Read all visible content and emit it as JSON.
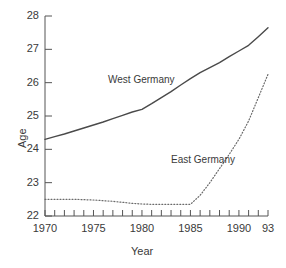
{
  "chart_data": {
    "type": "line",
    "title": "",
    "xlabel": "Year",
    "ylabel": "Age",
    "xlim": [
      1970,
      1993
    ],
    "ylim": [
      22,
      28
    ],
    "grid": false,
    "legend_position": "inline-annotation",
    "x_tick_labels": [
      "1970",
      "1975",
      "1980",
      "1985",
      "1990",
      "93"
    ],
    "x_tick_values": [
      1970,
      1975,
      1980,
      1985,
      1990,
      1993
    ],
    "x_minor_ticks": [
      1971,
      1972,
      1973,
      1974,
      1976,
      1977,
      1978,
      1979,
      1981,
      1982,
      1983,
      1984,
      1986,
      1987,
      1988,
      1989,
      1991,
      1992
    ],
    "y_tick_labels": [
      "22",
      "23",
      "24",
      "25",
      "26",
      "27",
      "28"
    ],
    "y_tick_values": [
      22,
      23,
      24,
      25,
      26,
      27,
      28
    ],
    "series": [
      {
        "name": "West Germany",
        "style": "solid",
        "color": "#4a4a4a",
        "x": [
          1970,
          1971,
          1972,
          1973,
          1974,
          1975,
          1976,
          1977,
          1978,
          1979,
          1980,
          1981,
          1982,
          1983,
          1984,
          1985,
          1986,
          1987,
          1988,
          1989,
          1990,
          1991,
          1992,
          1993
        ],
        "values": [
          24.3,
          24.38,
          24.46,
          24.55,
          24.64,
          24.73,
          24.82,
          24.92,
          25.02,
          25.12,
          25.2,
          25.37,
          25.55,
          25.73,
          25.93,
          26.12,
          26.3,
          26.45,
          26.6,
          26.78,
          26.95,
          27.12,
          27.38,
          27.65
        ]
      },
      {
        "name": "East Germany",
        "style": "dotted",
        "color": "#6a6a6a",
        "x": [
          1970,
          1971,
          1972,
          1973,
          1974,
          1975,
          1976,
          1977,
          1978,
          1979,
          1980,
          1981,
          1982,
          1983,
          1984,
          1985,
          1986,
          1987,
          1988,
          1989,
          1990,
          1991,
          1992,
          1993
        ],
        "values": [
          22.5,
          22.5,
          22.5,
          22.5,
          22.49,
          22.48,
          22.46,
          22.44,
          22.41,
          22.38,
          22.36,
          22.35,
          22.35,
          22.35,
          22.35,
          22.35,
          22.62,
          23.0,
          23.42,
          23.85,
          24.3,
          24.85,
          25.55,
          26.25
        ]
      }
    ],
    "annotations": [
      {
        "text": "West Germany",
        "x": 1976.5,
        "y": 26.05
      },
      {
        "text": "East Germany",
        "x": 1983.0,
        "y": 23.65
      }
    ]
  }
}
